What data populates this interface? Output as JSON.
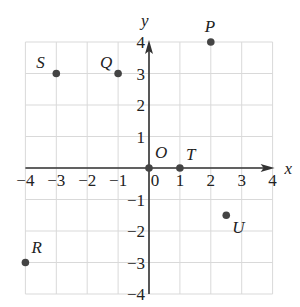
{
  "chart_data": {
    "type": "scatter",
    "title": "",
    "xlabel": "x",
    "ylabel": "y",
    "xlim": [
      -4,
      4
    ],
    "ylim": [
      -4,
      4
    ],
    "grid": true,
    "x_ticks": [
      "-4",
      "-3",
      "-2",
      "-1",
      "0",
      "1",
      "2",
      "3",
      "4"
    ],
    "y_ticks": [
      "-4",
      "-3",
      "-2",
      "-1",
      "1",
      "2",
      "3",
      "4"
    ],
    "origin_label": "O",
    "points": [
      {
        "label": "P",
        "x": 2,
        "y": 4
      },
      {
        "label": "Q",
        "x": -1,
        "y": 3
      },
      {
        "label": "S",
        "x": -3,
        "y": 3
      },
      {
        "label": "O",
        "x": 0,
        "y": 0
      },
      {
        "label": "T",
        "x": 1,
        "y": 0
      },
      {
        "label": "U",
        "x": 2.5,
        "y": -1.5
      },
      {
        "label": "R",
        "x": -4,
        "y": -3
      }
    ]
  },
  "colors": {
    "grid": "#d9d9d9",
    "axis": "#333333",
    "point": "#444444",
    "text": "#222222"
  }
}
